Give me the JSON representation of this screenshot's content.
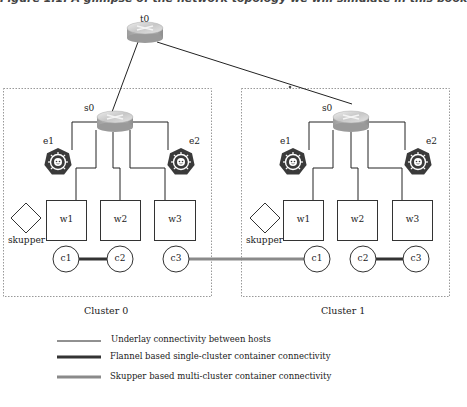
{
  "caption": "Figure 1.1: A glimpse of the network topology we will simulate in this book",
  "colors": {
    "underlay": "#222222",
    "flannel": "#333333",
    "skupper": "#8a8a8a",
    "cluster_border": "#999999",
    "router_top": "#d9d9d9",
    "router_side": "#a8a8a8",
    "kube_hex": "#3a3a3a"
  },
  "top_router": {
    "label": "t0",
    "icon": "router-icon"
  },
  "clusters": [
    {
      "label": "Cluster 0",
      "switch": {
        "label": "s0",
        "icon": "router-icon"
      },
      "edges": [
        {
          "label": "e1",
          "icon": "kubernetes-icon"
        },
        {
          "label": "e2",
          "icon": "kubernetes-icon"
        }
      ],
      "workers": [
        {
          "label": "w1"
        },
        {
          "label": "w2"
        },
        {
          "label": "w3"
        }
      ],
      "skupper": {
        "label": "skupper",
        "icon": "diamond-icon"
      },
      "containers": [
        {
          "label": "c1"
        },
        {
          "label": "c2"
        },
        {
          "label": "c3"
        }
      ]
    },
    {
      "label": "Cluster 1",
      "switch": {
        "label": "s0",
        "icon": "router-icon"
      },
      "edges": [
        {
          "label": "e1",
          "icon": "kubernetes-icon"
        },
        {
          "label": "e2",
          "icon": "kubernetes-icon"
        }
      ],
      "workers": [
        {
          "label": "w1"
        },
        {
          "label": "w2"
        },
        {
          "label": "w3"
        }
      ],
      "skupper": {
        "label": "skupper",
        "icon": "diamond-icon"
      },
      "containers": [
        {
          "label": "c1"
        },
        {
          "label": "c2"
        },
        {
          "label": "c3"
        }
      ]
    }
  ],
  "links": {
    "flannel": [
      [
        "cluster0.c1",
        "cluster0.c2"
      ],
      [
        "cluster1.c2",
        "cluster1.c3"
      ]
    ],
    "skupper": [
      [
        "cluster0.c3",
        "cluster1.c1"
      ]
    ]
  },
  "legend": [
    {
      "type": "underlay",
      "text": "Underlay connectivity between hosts"
    },
    {
      "type": "flannel",
      "text": "Flannel based single-cluster container connectivity"
    },
    {
      "type": "skupper",
      "text": "Skupper based multi-cluster container connectivity"
    }
  ]
}
